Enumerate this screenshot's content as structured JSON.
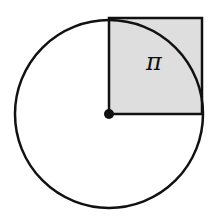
{
  "diagram": {
    "label": "π",
    "colors": {
      "stroke": "#111111",
      "square_fill": "#dedede",
      "background": "#ffffff"
    },
    "shapes": {
      "circle": {
        "cx": 109,
        "cy": 114,
        "r": 94
      },
      "square": {
        "x": 109,
        "y": 18,
        "size": 93
      },
      "center_dot": {
        "cx": 109,
        "cy": 114,
        "r": 5
      }
    }
  }
}
